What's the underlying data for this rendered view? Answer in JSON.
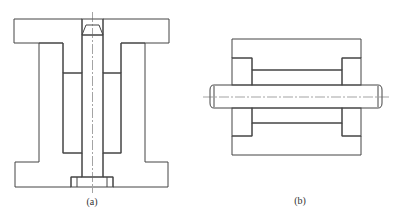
{
  "figures": [
    {
      "id": "a",
      "caption": "(a)",
      "description": "Vertical section of rubber mount: upper flanged plate with central bore and chamfered bolt head, lower flanged base, rubber sleeves between inner core and outer column"
    },
    {
      "id": "b",
      "caption": "(b)",
      "description": "Horizontal section of rubber bushing: outer housing, stepped inserts at both ends, rubber sleeves around through shaft"
    }
  ],
  "colors": {
    "line": "#444444",
    "hatch": "#8a8a8a",
    "background": "#ffffff"
  }
}
